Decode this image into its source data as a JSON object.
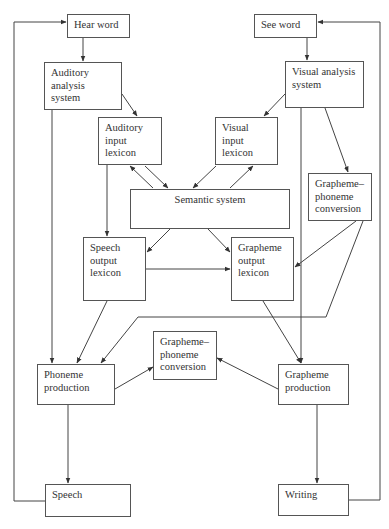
{
  "diagram": {
    "type": "cognitive-neuropsychology dual-route model of word processing",
    "nodes": {
      "hear_word": {
        "lines": [
          "Hear word"
        ]
      },
      "see_word": {
        "lines": [
          "See word"
        ]
      },
      "auditory_analysis": {
        "lines": [
          "Auditory",
          "analysis",
          "system"
        ]
      },
      "visual_analysis": {
        "lines": [
          "Visual analysis",
          "system"
        ]
      },
      "auditory_input_lexicon": {
        "lines": [
          "Auditory",
          "input",
          "lexicon"
        ]
      },
      "visual_input_lexicon": {
        "lines": [
          "Visual",
          "input",
          "lexicon"
        ]
      },
      "semantic_system": {
        "lines": [
          "Semantic system"
        ]
      },
      "gpc_right": {
        "lines": [
          "Grapheme–",
          "phoneme",
          "conversion"
        ]
      },
      "speech_output_lexicon": {
        "lines": [
          "Speech",
          "output",
          "lexicon"
        ]
      },
      "grapheme_output_lexicon": {
        "lines": [
          "Grapheme",
          "output",
          "lexicon"
        ]
      },
      "gpc_middle": {
        "lines": [
          "Grapheme–",
          "phoneme",
          "conversion"
        ]
      },
      "phoneme_production": {
        "lines": [
          "Phoneme",
          "production"
        ]
      },
      "grapheme_production": {
        "lines": [
          "Grapheme",
          "production"
        ]
      },
      "speech": {
        "lines": [
          "Speech"
        ]
      },
      "writing": {
        "lines": [
          "Writing"
        ]
      }
    },
    "edges": [
      {
        "from": "hear_word",
        "to": "auditory_analysis"
      },
      {
        "from": "auditory_analysis",
        "to": "auditory_input_lexicon"
      },
      {
        "from": "auditory_analysis",
        "to": "phoneme_production"
      },
      {
        "from": "see_word",
        "to": "visual_analysis"
      },
      {
        "from": "visual_analysis",
        "to": "visual_input_lexicon"
      },
      {
        "from": "visual_analysis",
        "to": "gpc_right"
      },
      {
        "from": "visual_analysis",
        "to": "grapheme_production"
      },
      {
        "from": "auditory_input_lexicon",
        "to": "semantic_system",
        "bidirectional": true
      },
      {
        "from": "visual_input_lexicon",
        "to": "semantic_system",
        "bidirectional": true
      },
      {
        "from": "auditory_input_lexicon",
        "to": "speech_output_lexicon"
      },
      {
        "from": "semantic_system",
        "to": "speech_output_lexicon"
      },
      {
        "from": "semantic_system",
        "to": "grapheme_output_lexicon"
      },
      {
        "from": "speech_output_lexicon",
        "to": "grapheme_output_lexicon"
      },
      {
        "from": "gpc_right",
        "to": "grapheme_output_lexicon"
      },
      {
        "from": "gpc_right",
        "to": "phoneme_production"
      },
      {
        "from": "speech_output_lexicon",
        "to": "phoneme_production"
      },
      {
        "from": "grapheme_output_lexicon",
        "to": "grapheme_production"
      },
      {
        "from": "phoneme_production",
        "to": "gpc_middle"
      },
      {
        "from": "grapheme_production",
        "to": "gpc_middle"
      },
      {
        "from": "phoneme_production",
        "to": "speech"
      },
      {
        "from": "grapheme_production",
        "to": "writing"
      },
      {
        "from": "speech",
        "to": "hear_word",
        "feedback": true
      },
      {
        "from": "writing",
        "to": "see_word",
        "feedback": true
      }
    ]
  }
}
